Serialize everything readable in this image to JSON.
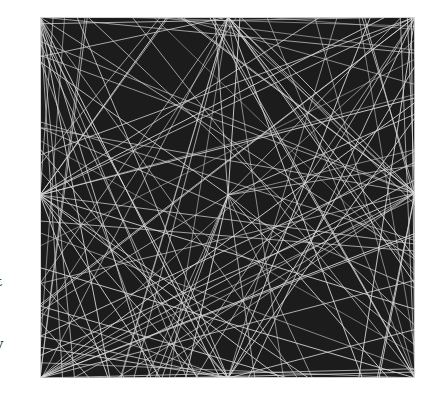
{
  "artwork": {
    "background": "#1c1c1c",
    "line_color": "#d8d8d8",
    "width": 375,
    "height": 361,
    "hubs": [
      {
        "name": "top-left",
        "x": 0,
        "y": 0
      },
      {
        "name": "top-mid",
        "x": 188,
        "y": 0
      },
      {
        "name": "top-right",
        "x": 375,
        "y": 0
      },
      {
        "name": "mid-left",
        "x": 0,
        "y": 178
      },
      {
        "name": "center",
        "x": 188,
        "y": 178
      },
      {
        "name": "mid-right",
        "x": 375,
        "y": 176
      },
      {
        "name": "bottom-left",
        "x": 0,
        "y": 361
      },
      {
        "name": "bottom-mid",
        "x": 188,
        "y": 361
      },
      {
        "name": "bottom-right",
        "x": 375,
        "y": 361
      }
    ],
    "rays_per_hub": 16,
    "random_lines": 40
  },
  "margin_text": [
    {
      "text": "t",
      "top": 275
    },
    {
      "text": ":",
      "top": 310
    },
    {
      "text": "y",
      "top": 337
    }
  ]
}
